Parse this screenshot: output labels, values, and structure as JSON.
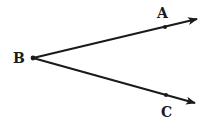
{
  "diagram": {
    "type": "angle",
    "vertex": {
      "label": "B",
      "x": 33,
      "y": 58
    },
    "rays": [
      {
        "name": "ray-BA",
        "point_label": "A",
        "point": {
          "x": 165,
          "y": 27
        },
        "tip": {
          "x": 197,
          "y": 19
        }
      },
      {
        "name": "ray-BC",
        "point_label": "C",
        "point": {
          "x": 166,
          "y": 95
        },
        "tip": {
          "x": 195,
          "y": 103
        }
      }
    ],
    "labels": {
      "A": "A",
      "B": "B",
      "C": "C"
    },
    "stroke_color": "#1a1a1a"
  }
}
